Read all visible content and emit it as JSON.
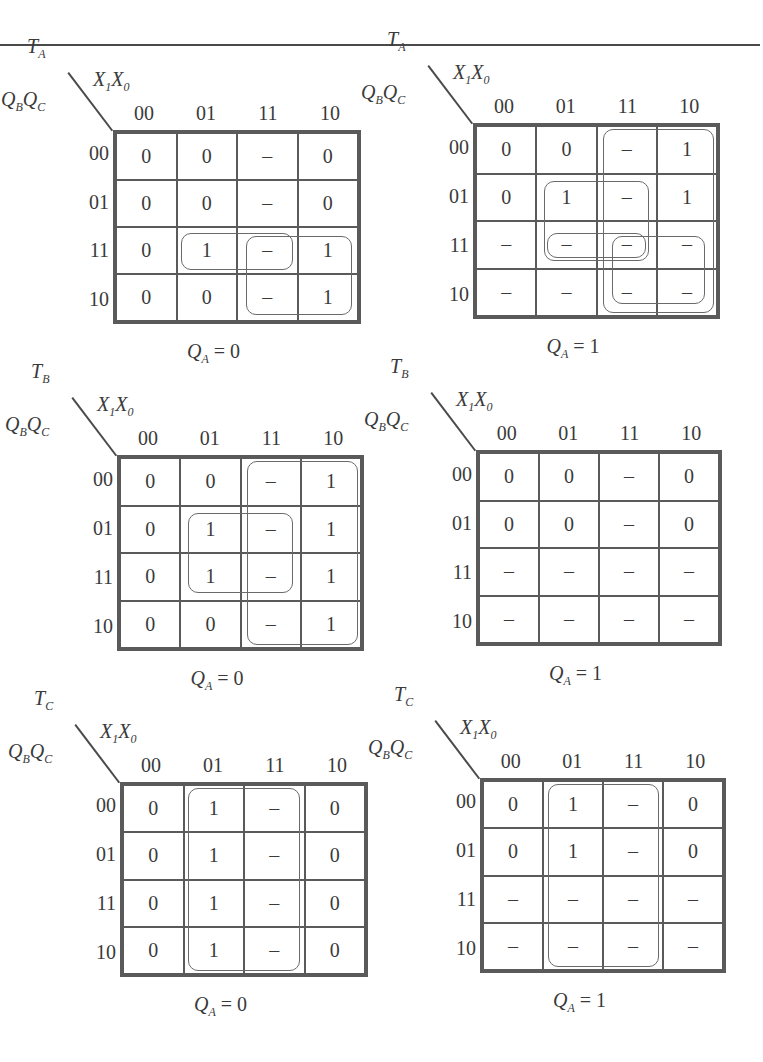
{
  "column_var_label": "X1X0",
  "row_var_label": "QBQC",
  "column_headers": [
    "00",
    "01",
    "11",
    "10"
  ],
  "row_headers": [
    "00",
    "01",
    "11",
    "10"
  ],
  "kmaps": [
    {
      "function": "T",
      "function_sub": "A",
      "qa_value": "0",
      "caption_eq": "= 0",
      "cells": [
        [
          "0",
          "0",
          "–",
          "0"
        ],
        [
          "0",
          "0",
          "–",
          "0"
        ],
        [
          "0",
          "1",
          "–",
          "1"
        ],
        [
          "0",
          "0",
          "–",
          "1"
        ]
      ],
      "groups": [
        {
          "rows": [
            2,
            2
          ],
          "cols": [
            1,
            2
          ]
        },
        {
          "rows": [
            2,
            3
          ],
          "cols": [
            2,
            3
          ]
        }
      ]
    },
    {
      "function": "T",
      "function_sub": "A",
      "qa_value": "1",
      "caption_eq": "= 1",
      "cells": [
        [
          "0",
          "0",
          "–",
          "1"
        ],
        [
          "0",
          "1",
          "–",
          "1"
        ],
        [
          "–",
          "–",
          "–",
          "–"
        ],
        [
          "–",
          "–",
          "–",
          "–"
        ]
      ],
      "groups": [
        {
          "rows": [
            0,
            3
          ],
          "cols": [
            2,
            3
          ]
        },
        {
          "rows": [
            1,
            2
          ],
          "cols": [
            1,
            2
          ]
        },
        {
          "rows": [
            2,
            2
          ],
          "cols": [
            1,
            2
          ]
        },
        {
          "rows": [
            2,
            3
          ],
          "cols": [
            2,
            3
          ]
        }
      ]
    },
    {
      "function": "T",
      "function_sub": "B",
      "qa_value": "0",
      "caption_eq": "= 0",
      "cells": [
        [
          "0",
          "0",
          "–",
          "1"
        ],
        [
          "0",
          "1",
          "–",
          "1"
        ],
        [
          "0",
          "1",
          "–",
          "1"
        ],
        [
          "0",
          "0",
          "–",
          "1"
        ]
      ],
      "groups": [
        {
          "rows": [
            0,
            3
          ],
          "cols": [
            2,
            3
          ]
        },
        {
          "rows": [
            1,
            2
          ],
          "cols": [
            1,
            2
          ]
        }
      ]
    },
    {
      "function": "T",
      "function_sub": "B",
      "qa_value": "1",
      "caption_eq": "= 1",
      "cells": [
        [
          "0",
          "0",
          "–",
          "0"
        ],
        [
          "0",
          "0",
          "–",
          "0"
        ],
        [
          "–",
          "–",
          "–",
          "–"
        ],
        [
          "–",
          "–",
          "–",
          "–"
        ]
      ],
      "groups": []
    },
    {
      "function": "T",
      "function_sub": "C",
      "qa_value": "0",
      "caption_eq": "= 0",
      "cells": [
        [
          "0",
          "1",
          "–",
          "0"
        ],
        [
          "0",
          "1",
          "–",
          "0"
        ],
        [
          "0",
          "1",
          "–",
          "0"
        ],
        [
          "0",
          "1",
          "–",
          "0"
        ]
      ],
      "groups": [
        {
          "rows": [
            0,
            3
          ],
          "cols": [
            1,
            2
          ]
        }
      ]
    },
    {
      "function": "T",
      "function_sub": "C",
      "qa_value": "1",
      "caption_eq": "= 1",
      "cells": [
        [
          "0",
          "1",
          "–",
          "0"
        ],
        [
          "0",
          "1",
          "–",
          "0"
        ],
        [
          "–",
          "–",
          "–",
          "–"
        ],
        [
          "–",
          "–",
          "–",
          "–"
        ]
      ],
      "groups": [
        {
          "rows": [
            0,
            3
          ],
          "cols": [
            1,
            2
          ]
        }
      ]
    }
  ]
}
